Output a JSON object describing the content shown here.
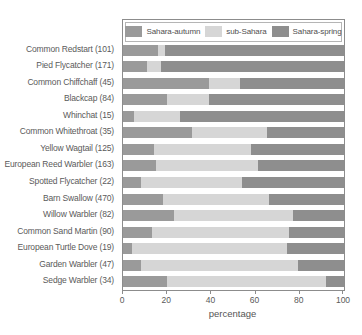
{
  "chart_data": {
    "type": "bar",
    "orientation": "horizontal",
    "stacked": true,
    "title": "",
    "xlabel": "percentage",
    "ylabel": "",
    "xlim": [
      0,
      100
    ],
    "xticks": [
      0,
      20,
      40,
      60,
      80,
      100
    ],
    "grid": false,
    "legend_position": "top",
    "categories": [
      "Common Redstart (101)",
      "Pied Flycatcher (171)",
      "Common Chiffchaff (45)",
      "Blackcap (84)",
      "Whinchat (15)",
      "Common Whitethroat (35)",
      "Yellow Wagtail (125)",
      "European Reed Warbler (163)",
      "Spotted Flycatcher (22)",
      "Barn Swallow (470)",
      "Willow Warbler (82)",
      "Common Sand Martin (90)",
      "European Turtle Dove (19)",
      "Garden Warbler (47)",
      "Sedge Warbler (34)"
    ],
    "series": [
      {
        "name": "Sahara-autumn",
        "color": "#9a9a9a",
        "values": [
          16,
          11,
          39,
          20,
          5,
          31,
          14,
          15,
          8,
          18,
          23,
          13,
          4,
          8,
          20
        ]
      },
      {
        "name": "sub-Sahara",
        "color": "#d6d6d6",
        "values": [
          3,
          6,
          14,
          19,
          21,
          34,
          44,
          46,
          46,
          48,
          54,
          62,
          70,
          71,
          72
        ]
      },
      {
        "name": "Sahara-spring",
        "color": "#8e8e8e",
        "values": [
          81,
          83,
          47,
          61,
          74,
          35,
          42,
          39,
          46,
          34,
          23,
          25,
          26,
          21,
          8
        ]
      }
    ]
  },
  "legend": {
    "entries": [
      {
        "label": "Sahara-autumn",
        "color": "#9a9a9a"
      },
      {
        "label": "sub-Sahara",
        "color": "#d6d6d6"
      },
      {
        "label": "Sahara-spring",
        "color": "#8e8e8e"
      }
    ]
  },
  "axis": {
    "x_title": "percentage",
    "x_tick_labels": [
      "0",
      "20",
      "40",
      "60",
      "80",
      "100"
    ]
  }
}
